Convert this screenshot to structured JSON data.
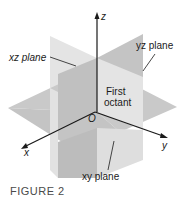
{
  "figure": {
    "caption": "FIGURE 2",
    "axes": {
      "x": "x",
      "y": "y",
      "z": "z",
      "origin": "O"
    },
    "planes": {
      "xz": "xz plane",
      "yz": "yz plane",
      "xy": "xy plane"
    },
    "region_label_line1": "First",
    "region_label_line2": "octant",
    "colors": {
      "plane_light": "#e6e6e6",
      "plane_mid": "#d2d2d2",
      "plane_dark": "#bdbdbd",
      "axis": "#1a1a1a"
    }
  }
}
